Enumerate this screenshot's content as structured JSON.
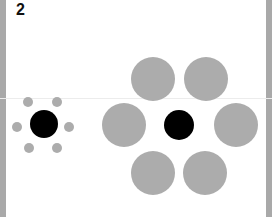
{
  "figure": {
    "label": "2",
    "colors": {
      "border": "#a9a9a9",
      "surround": "#acacac",
      "target": "#000000",
      "background": "#ffffff"
    },
    "groups": [
      {
        "name": "small-surround-group",
        "center": {
          "cx": 44,
          "cy": 124,
          "r": 14
        },
        "surrounds": [
          {
            "cx": 28,
            "cy": 102,
            "r": 5
          },
          {
            "cx": 57,
            "cy": 102,
            "r": 5
          },
          {
            "cx": 17,
            "cy": 127,
            "r": 5
          },
          {
            "cx": 69,
            "cy": 127,
            "r": 5
          },
          {
            "cx": 29,
            "cy": 148,
            "r": 5
          },
          {
            "cx": 57,
            "cy": 148,
            "r": 5
          }
        ]
      },
      {
        "name": "large-surround-group",
        "center": {
          "cx": 179,
          "cy": 125,
          "r": 15
        },
        "surrounds": [
          {
            "cx": 153,
            "cy": 79,
            "r": 22
          },
          {
            "cx": 206,
            "cy": 79,
            "r": 22
          },
          {
            "cx": 124,
            "cy": 125,
            "r": 22
          },
          {
            "cx": 236,
            "cy": 125,
            "r": 22
          },
          {
            "cx": 153,
            "cy": 173,
            "r": 22
          },
          {
            "cx": 205,
            "cy": 173,
            "r": 22
          }
        ]
      }
    ]
  }
}
